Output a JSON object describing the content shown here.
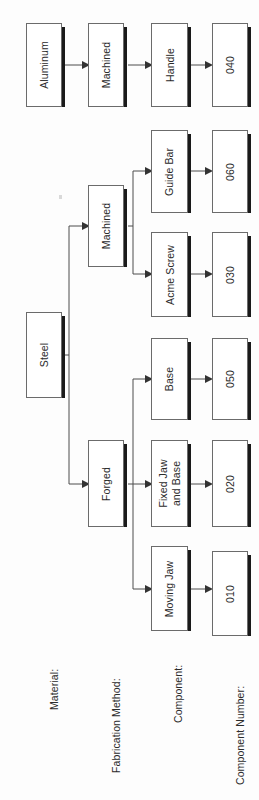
{
  "diagram": {
    "orientation": "rotated-90-ccw",
    "row_labels": [
      {
        "id": "material",
        "text": "Material:"
      },
      {
        "id": "fabrication_method",
        "text": "Fabrication Method:"
      },
      {
        "id": "component",
        "text": "Component:"
      },
      {
        "id": "component_number",
        "text": "Component Number:"
      }
    ],
    "nodes": {
      "aluminum": "Aluminum",
      "steel": "Steel",
      "machined_aluminum": "Machined",
      "machined_steel": "Machined",
      "forged": "Forged",
      "handle": "Handle",
      "guide_bar": "Guide Bar",
      "acme_screw": "Acme Screw",
      "base": "Base",
      "fixed_jaw_and_base": "Fixed Jaw\nand Base",
      "moving_jaw": "Moving Jaw",
      "num_040": "040",
      "num_060": "060",
      "num_030": "030",
      "num_050": "050",
      "num_020": "020",
      "num_010": "010"
    },
    "colors": {
      "box_fill": "#ffffff",
      "box_border": "#6b6b6b",
      "box_shadow": "#1a1a1a",
      "connector": "#4d4d4d",
      "text": "#2b2b2b",
      "background": "#fdfdfd"
    }
  }
}
